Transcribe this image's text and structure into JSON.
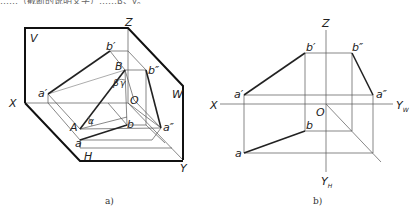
{
  "header_text_fragment": "……（截断的说明文字）……β、γ。",
  "figure_a": {
    "caption": "a)",
    "planes": {
      "V": "V",
      "H": "H",
      "W": "W"
    },
    "axes": {
      "X": "X",
      "Y": "Y",
      "Z": "Z",
      "origin": "O"
    },
    "points": {
      "A": "A",
      "B": "B",
      "a": "a",
      "b": "b",
      "a_prime": "a′",
      "b_prime": "b′",
      "a_double_prime": "a″",
      "b_double_prime": "b″"
    },
    "angles": {
      "alpha": "α",
      "beta": "β",
      "gamma": "γ"
    }
  },
  "figure_b": {
    "caption": "b)",
    "axes": {
      "X": "X",
      "Z": "Z",
      "Y_W": "Y",
      "Y_W_sub": "W",
      "Y_H": "Y",
      "Y_H_sub": "H",
      "origin": "O"
    },
    "points": {
      "a": "a",
      "b": "b",
      "a_prime": "a′",
      "b_prime": "b′",
      "a_double_prime": "a″",
      "b_double_prime": "b″"
    }
  }
}
